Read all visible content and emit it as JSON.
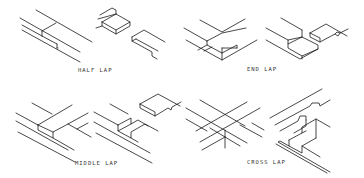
{
  "figure": {
    "background": "#ffffff",
    "line_color": "#1a1a1a",
    "panels": [
      {
        "id": "half-lap",
        "label": "HALF LAP",
        "label_pos": [
          78,
          67
        ],
        "polylines": [
          [
            [
              36,
              10
            ],
            [
              92,
              42
            ]
          ],
          [
            [
              20,
              18
            ],
            [
              80,
              52
            ]
          ],
          [
            [
              22,
              30
            ],
            [
              80,
              62
            ]
          ],
          [
            [
              42,
              31
            ],
            [
              56,
              23
            ]
          ],
          [
            [
              42,
              31
            ],
            [
              42,
              36
            ]
          ],
          [
            [
              42,
              36
            ],
            [
              57,
              44
            ]
          ],
          [
            [
              57,
              44
            ],
            [
              57,
              48
            ]
          ],
          [
            [
              42,
              36
            ],
            [
              22,
              25
            ]
          ],
          [
            [
              57,
              48
            ],
            [
              58,
              48
            ]
          ],
          [
            [
              100,
              15
            ],
            [
              112,
              8
            ],
            [
              116,
              10
            ],
            [
              116,
              14
            ]
          ],
          [
            [
              98,
              19
            ],
            [
              116,
              14
            ]
          ],
          [
            [
              102,
              22
            ],
            [
              116,
              14
            ],
            [
              130,
              22
            ],
            [
              116,
              30
            ],
            [
              102,
              22
            ]
          ],
          [
            [
              102,
              22
            ],
            [
              102,
              26
            ],
            [
              116,
              34
            ],
            [
              130,
              26
            ],
            [
              130,
              22
            ]
          ],
          [
            [
              116,
              30
            ],
            [
              116,
              34
            ]
          ],
          [
            [
              96,
              28
            ],
            [
              102,
              26
            ]
          ],
          [
            [
              132,
              37
            ],
            [
              144,
              30
            ],
            [
              165,
              42
            ]
          ],
          [
            [
              132,
              37
            ],
            [
              132,
              41
            ],
            [
              152,
              52
            ],
            [
              152,
              56
            ],
            [
              157,
              59
            ]
          ],
          [
            [
              132,
              41
            ],
            [
              136,
              39
            ]
          ],
          [
            [
              136,
              39
            ],
            [
              158,
              51
            ]
          ]
        ]
      },
      {
        "id": "end-lap",
        "label": "END LAP",
        "label_pos": [
          247,
          66
        ],
        "polylines": [
          [
            [
              200,
              20
            ],
            [
              222,
              32
            ],
            [
              245,
              19
            ]
          ],
          [
            [
              184,
              28
            ],
            [
              207,
              41
            ]
          ],
          [
            [
              186,
              40
            ],
            [
              222,
              60
            ],
            [
              257,
              40
            ]
          ],
          [
            [
              207,
              41
            ],
            [
              222,
              33
            ],
            [
              246,
              28
            ]
          ],
          [
            [
              207,
              41
            ],
            [
              207,
              45
            ],
            [
              222,
              53
            ],
            [
              237,
              45
            ],
            [
              237,
              48
            ]
          ],
          [
            [
              207,
              45
            ],
            [
              198,
              50
            ]
          ],
          [
            [
              222,
              53
            ],
            [
              222,
              60
            ]
          ],
          [
            [
              222,
              48
            ],
            [
              237,
              48
            ]
          ],
          [
            [
              222,
              48
            ],
            [
              222,
              53
            ]
          ],
          [
            [
              204,
              51
            ],
            [
              212,
              47
            ]
          ],
          [
            [
              281,
              18
            ],
            [
              302,
              30
            ]
          ],
          [
            [
              266,
              28
            ],
            [
              288,
              40
            ]
          ],
          [
            [
              266,
              40
            ],
            [
              300,
              59
            ],
            [
              318,
              49
            ],
            [
              318,
              45
            ],
            [
              302,
              37
            ],
            [
              288,
              40
            ],
            [
              288,
              44
            ],
            [
              302,
              37
            ]
          ],
          [
            [
              288,
              44
            ],
            [
              288,
              48
            ],
            [
              302,
              56
            ],
            [
              318,
              49
            ]
          ],
          [
            [
              302,
              56
            ],
            [
              302,
              59
            ]
          ],
          [
            [
              302,
              30
            ],
            [
              302,
              37
            ]
          ],
          [
            [
              310,
              33
            ],
            [
              326,
              24
            ],
            [
              347,
              36
            ]
          ],
          [
            [
              310,
              33
            ],
            [
              310,
              37
            ],
            [
              320,
              42
            ],
            [
              335,
              34
            ],
            [
              338,
              36
            ],
            [
              340,
              33
            ],
            [
              348,
              29
            ]
          ],
          [
            [
              320,
              42
            ],
            [
              320,
              38
            ],
            [
              310,
              33
            ]
          ],
          [
            [
              335,
              34
            ],
            [
              337,
              32
            ],
            [
              340,
              33
            ]
          ]
        ]
      },
      {
        "id": "middle-lap",
        "label": "MIDDLE LAP",
        "label_pos": [
          75,
          160
        ],
        "polylines": [
          [
            [
              32,
              103
            ],
            [
              52,
              114
            ]
          ],
          [
            [
              16,
              113
            ],
            [
              38,
              125
            ]
          ],
          [
            [
              16,
              121
            ],
            [
              68,
              150
            ]
          ],
          [
            [
              18,
              132
            ],
            [
              75,
              162
            ]
          ],
          [
            [
              38,
              125
            ],
            [
              72,
              105
            ]
          ],
          [
            [
              38,
              125
            ],
            [
              38,
              130
            ],
            [
              53,
              138
            ],
            [
              53,
              132
            ],
            [
              68,
              124
            ],
            [
              88,
              113
            ]
          ],
          [
            [
              53,
              132
            ],
            [
              38,
              125
            ]
          ],
          [
            [
              53,
              138
            ],
            [
              74,
              150
            ]
          ],
          [
            [
              68,
              124
            ],
            [
              91,
              137
            ]
          ],
          [
            [
              77,
              129
            ],
            [
              88,
              123
            ]
          ],
          [
            [
              110,
              104
            ],
            [
              128,
              114
            ]
          ],
          [
            [
              94,
              112
            ],
            [
              118,
              125
            ]
          ],
          [
            [
              94,
              122
            ],
            [
              150,
              153
            ]
          ],
          [
            [
              96,
              133
            ],
            [
              152,
              163
            ]
          ],
          [
            [
              118,
              125
            ],
            [
              131,
              118
            ],
            [
              131,
              124
            ],
            [
              138,
              120
            ],
            [
              148,
              126
            ]
          ],
          [
            [
              118,
              125
            ],
            [
              118,
              131
            ],
            [
              131,
              124
            ]
          ],
          [
            [
              118,
              131
            ],
            [
              131,
              138
            ],
            [
              131,
              132
            ],
            [
              145,
              124
            ],
            [
              158,
              131
            ]
          ],
          [
            [
              131,
              138
            ],
            [
              138,
              142
            ]
          ],
          [
            [
              140,
              104
            ],
            [
              158,
              94
            ],
            [
              180,
              106
            ]
          ],
          [
            [
              140,
              104
            ],
            [
              140,
              108
            ],
            [
              155,
              116
            ],
            [
              168,
              108
            ],
            [
              171,
              110
            ],
            [
              172,
              107
            ],
            [
              181,
              102
            ]
          ],
          [
            [
              155,
              116
            ],
            [
              155,
              112
            ],
            [
              140,
              104
            ]
          ]
        ]
      },
      {
        "id": "cross-lap",
        "label": "CROSS LAP",
        "label_pos": [
          247,
          159
        ],
        "polylines": [
          [
            [
              200,
              100
            ],
            [
              245,
              126
            ]
          ],
          [
            [
              186,
              108
            ],
            [
              247,
              143
            ]
          ],
          [
            [
              186,
              119
            ],
            [
              207,
              131
            ]
          ],
          [
            [
              196,
              131
            ],
            [
              247,
              102
            ]
          ],
          [
            [
              200,
              142
            ],
            [
              260,
              108
            ]
          ],
          [
            [
              225,
              130
            ],
            [
              225,
              148
            ]
          ],
          [
            [
              225,
              137
            ],
            [
              240,
              146
            ]
          ],
          [
            [
              202,
              150
            ],
            [
              225,
              137
            ]
          ],
          [
            [
              240,
              125
            ],
            [
              262,
              137
            ]
          ],
          [
            [
              252,
              123
            ],
            [
              264,
              130
            ]
          ],
          [
            [
              225,
              137
            ],
            [
              210,
              128
            ]
          ],
          [
            [
              270,
              118
            ],
            [
              322,
              89
            ]
          ],
          [
            [
              275,
              125
            ],
            [
              310,
              106
            ],
            [
              312,
              103
            ],
            [
              319,
              103
            ],
            [
              320,
              106
            ],
            [
              330,
              100
            ]
          ],
          [
            [
              280,
              131
            ],
            [
              298,
              121
            ],
            [
              300,
              116
            ],
            [
              306,
              116
            ],
            [
              306,
              120
            ]
          ],
          [
            [
              289,
              140
            ],
            [
              302,
              133
            ],
            [
              302,
              127
            ],
            [
              316,
              119
            ],
            [
              330,
              127
            ]
          ],
          [
            [
              289,
              140
            ],
            [
              289,
              146
            ],
            [
              302,
              153
            ],
            [
              302,
              146
            ],
            [
              316,
              138
            ]
          ],
          [
            [
              289,
              146
            ],
            [
              280,
              141
            ],
            [
              278,
              142
            ],
            [
              330,
              172
            ]
          ],
          [
            [
              302,
              146
            ],
            [
              320,
              157
            ]
          ],
          [
            [
              302,
              133
            ],
            [
              306,
              131
            ]
          ],
          [
            [
              306,
              120
            ],
            [
              306,
              126
            ],
            [
              294,
              133
            ]
          ],
          [
            [
              316,
              119
            ],
            [
              316,
              138
            ]
          ],
          [
            [
              276,
              144
            ],
            [
              327,
              173
            ]
          ]
        ]
      }
    ]
  }
}
